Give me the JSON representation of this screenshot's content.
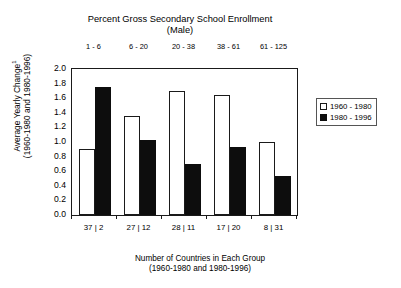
{
  "chart_data": {
    "type": "bar",
    "title": "Percent Gross Secondary School Enrollment",
    "subtitle": "(Male)",
    "categories": [
      "1 - 6",
      "6 - 20",
      "20 - 38",
      "38 - 61",
      "61 - 125"
    ],
    "secondary_categories": [
      "37 | 2",
      "27 | 12",
      "28 | 11",
      "17 | 20",
      "8 | 31"
    ],
    "series": [
      {
        "name": "1960 - 1980",
        "values": [
          0.9,
          1.35,
          1.7,
          1.65,
          1.0
        ],
        "color": "#ffffff"
      },
      {
        "name": "1980 - 1996",
        "values": [
          1.76,
          1.03,
          0.7,
          0.93,
          0.54
        ],
        "color": "#0d0d0d"
      }
    ],
    "xlabel": "Number of Countries in Each Group",
    "xlabel_sub": "(1960-1980 and 1980-1996)",
    "ylabel": "Average Yearly Change",
    "ylabel_superscript": "1",
    "ylabel_sub": "(1960-1980 and 1980-1996)",
    "ylim": [
      0.0,
      2.0
    ],
    "ytick_labels": [
      "2.0",
      "1.8",
      "1.6",
      "1.4",
      "1.2",
      "1.0",
      "0.8",
      "0.6",
      "0.4",
      "0.2",
      "0.0"
    ],
    "ytick_values": [
      2.0,
      1.8,
      1.6,
      1.4,
      1.2,
      1.0,
      0.8,
      0.6,
      0.4,
      0.2,
      0.0
    ],
    "grid": false,
    "legend_position": "right"
  },
  "legend": {
    "entries": [
      {
        "label": "1960 - 1980",
        "swatch": "light-square-icon"
      },
      {
        "label": "1980 - 1996",
        "swatch": "dark-square-icon"
      }
    ]
  }
}
